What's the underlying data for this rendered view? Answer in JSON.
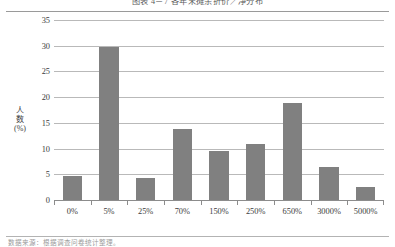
{
  "figure": {
    "caption": "图表 4－7  各年末摊余折价／净分布",
    "footnote": "数据来源：根据调查问卷统计整理。"
  },
  "axes": {
    "y_title_chars": [
      "人",
      "数",
      "(%)"
    ],
    "y_ticks": [
      0,
      5,
      10,
      15,
      20,
      25,
      30,
      35
    ],
    "y_min": 0,
    "y_max": 35
  },
  "style": {
    "bar_color": "#808080",
    "grid_color": "#b9b9b9",
    "axis_color": "#8c8c8c",
    "background": "#ffffff",
    "text_color": "#3c3c3c"
  },
  "chart_data": {
    "type": "bar",
    "title": "图表 4－7  各年末摊余折价／净分布",
    "categories": [
      "0%",
      "5%",
      "25%",
      "70%",
      "150%",
      "250%",
      "650%",
      "3000%",
      "5000%"
    ],
    "values": [
      4.6,
      29.7,
      4.2,
      13.8,
      9.5,
      10.9,
      18.8,
      6.4,
      2.6
    ],
    "xlabel": "",
    "ylabel": "人数(%)",
    "ylim": [
      0,
      35
    ],
    "ytick_step": 5,
    "grid": true,
    "legend": "none",
    "series": [
      {
        "name": "人数(%)",
        "values": [
          4.6,
          29.7,
          4.2,
          13.8,
          9.5,
          10.9,
          18.8,
          6.4,
          2.6
        ]
      }
    ]
  }
}
